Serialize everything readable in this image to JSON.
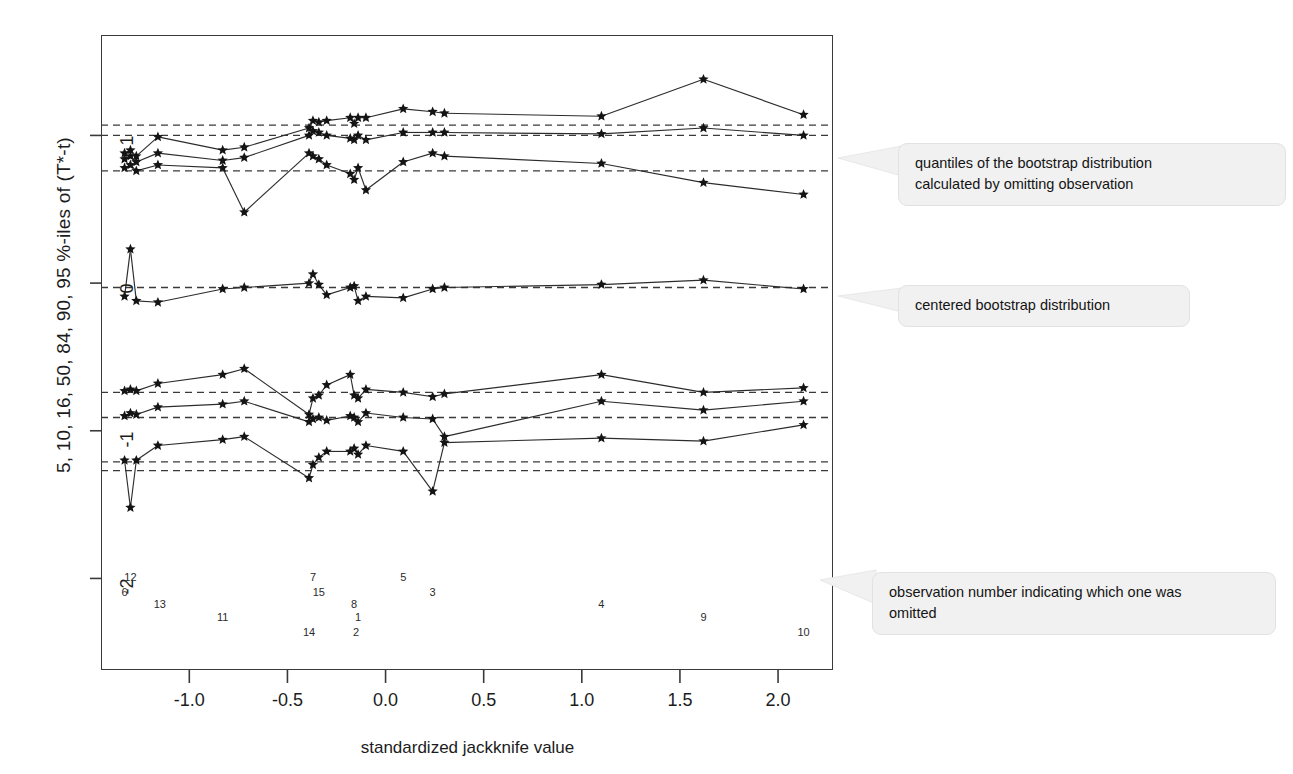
{
  "figure": {
    "ylabel": "5, 10, 16, 50, 84, 90, 95 %-iles of (T*-t)",
    "xlabel": "standardized jackknife value"
  },
  "annotations": [
    {
      "id": "quantiles-note",
      "line1": "quantiles of the bootstrap  distribution",
      "line2": "calculated by omitting observation"
    },
    {
      "id": "centered-note",
      "line1": "centered bootstrap distribution",
      "line2": ""
    },
    {
      "id": "obsnum-note",
      "line1": "observation number indicating which one was",
      "line2": "omitted"
    }
  ],
  "chart_data": {
    "type": "scatter",
    "title": "",
    "xlabel": "standardized jackknife value",
    "ylabel": "5, 10, 16, 50, 84, 90, 95 %-iles of (T*-t)",
    "xlim": [
      -1.45,
      2.28
    ],
    "ylim": [
      -2.62,
      1.68
    ],
    "xticks": [
      -1.0,
      -0.5,
      0.0,
      0.5,
      1.0,
      1.5,
      2.0
    ],
    "xticklabels": [
      "-1.0",
      "-0.5",
      "0.0",
      "0.5",
      "1.0",
      "1.5",
      "2.0"
    ],
    "yticks": [
      1,
      0,
      -1,
      -2
    ],
    "yticklabels": [
      "1",
      "0",
      "-1",
      "-2"
    ],
    "grid": false,
    "legend": null,
    "marker": "asterisk",
    "quantile_levels": [
      5,
      10,
      16,
      50,
      84,
      90,
      95
    ],
    "reference_lines": {
      "description": "horizontal dashed lines = overall bootstrap quantiles",
      "values": [
        1.07,
        1.0,
        0.76,
        -0.03,
        -0.74,
        -0.91,
        -1.21,
        -1.27
      ]
    },
    "observation_labels": [
      {
        "label": "12",
        "x": -1.3,
        "y": -2.0
      },
      {
        "label": "6",
        "x": -1.33,
        "y": -2.1
      },
      {
        "label": "13",
        "x": -1.15,
        "y": -2.18
      },
      {
        "label": "11",
        "x": -0.83,
        "y": -2.27
      },
      {
        "label": "7",
        "x": -0.37,
        "y": -2.0
      },
      {
        "label": "15",
        "x": -0.34,
        "y": -2.1
      },
      {
        "label": "14",
        "x": -0.39,
        "y": -2.37
      },
      {
        "label": "8",
        "x": -0.16,
        "y": -2.18
      },
      {
        "label": "1",
        "x": -0.14,
        "y": -2.27
      },
      {
        "label": "2",
        "x": -0.15,
        "y": -2.37
      },
      {
        "label": "5",
        "x": 0.09,
        "y": -2.0
      },
      {
        "label": "3",
        "x": 0.24,
        "y": -2.1
      },
      {
        "label": "4",
        "x": 1.1,
        "y": -2.18
      },
      {
        "label": "9",
        "x": 1.62,
        "y": -2.27
      },
      {
        "label": "10",
        "x": 2.13,
        "y": -2.37
      }
    ],
    "series": [
      {
        "name": "95%-ile",
        "level": 95,
        "x": [
          -1.33,
          -1.3,
          -1.27,
          -1.16,
          -0.83,
          -0.72,
          -0.39,
          -0.37,
          -0.34,
          -0.3,
          -0.18,
          -0.16,
          -0.14,
          -0.1,
          0.09,
          0.24,
          0.3,
          1.1,
          1.62,
          2.13
        ],
        "y": [
          0.88,
          0.9,
          0.86,
          0.99,
          0.9,
          0.92,
          1.05,
          1.1,
          1.09,
          1.1,
          1.12,
          1.08,
          1.12,
          1.12,
          1.18,
          1.16,
          1.15,
          1.13,
          1.38,
          1.14
        ]
      },
      {
        "name": "90%-ile",
        "level": 90,
        "x": [
          -1.33,
          -1.3,
          -1.27,
          -1.16,
          -0.83,
          -0.72,
          -0.39,
          -0.37,
          -0.34,
          -0.3,
          -0.18,
          -0.16,
          -0.14,
          -0.1,
          0.09,
          0.24,
          0.3,
          1.1,
          1.62,
          2.13
        ],
        "y": [
          0.84,
          0.86,
          0.82,
          0.88,
          0.83,
          0.85,
          1.0,
          1.03,
          1.02,
          1.0,
          0.98,
          0.97,
          1.0,
          0.97,
          1.02,
          1.02,
          1.02,
          1.01,
          1.05,
          1.0
        ]
      },
      {
        "name": "84%-ile",
        "level": 84,
        "x": [
          -1.33,
          -1.3,
          -1.27,
          -1.16,
          -0.83,
          -0.72,
          -0.39,
          -0.37,
          -0.34,
          -0.3,
          -0.18,
          -0.16,
          -0.14,
          -0.1,
          0.09,
          0.24,
          0.3,
          1.1,
          1.62,
          2.13
        ],
        "y": [
          0.78,
          0.8,
          0.76,
          0.8,
          0.78,
          0.48,
          0.88,
          0.86,
          0.84,
          0.8,
          0.74,
          0.7,
          0.78,
          0.63,
          0.82,
          0.88,
          0.86,
          0.81,
          0.68,
          0.6
        ]
      },
      {
        "name": "50%-ile (median)",
        "level": 50,
        "x": [
          -1.33,
          -1.3,
          -1.27,
          -1.16,
          -0.83,
          -0.72,
          -0.39,
          -0.37,
          -0.34,
          -0.3,
          -0.18,
          -0.16,
          -0.14,
          -0.1,
          0.09,
          0.24,
          0.3,
          1.1,
          1.62,
          2.13
        ],
        "y": [
          -0.09,
          0.23,
          -0.12,
          -0.13,
          -0.04,
          -0.03,
          0.0,
          0.06,
          -0.01,
          -0.08,
          -0.03,
          -0.02,
          -0.12,
          -0.09,
          -0.1,
          -0.04,
          -0.03,
          -0.01,
          0.02,
          -0.04
        ]
      },
      {
        "name": "16%-ile",
        "level": 16,
        "x": [
          -1.33,
          -1.3,
          -1.27,
          -1.16,
          -0.83,
          -0.72,
          -0.39,
          -0.37,
          -0.34,
          -0.3,
          -0.18,
          -0.16,
          -0.14,
          -0.1,
          0.09,
          0.24,
          0.3,
          1.1,
          1.62,
          2.13
        ],
        "y": [
          -0.73,
          -0.72,
          -0.73,
          -0.68,
          -0.62,
          -0.58,
          -0.89,
          -0.78,
          -0.76,
          -0.69,
          -0.62,
          -0.76,
          -0.78,
          -0.72,
          -0.74,
          -0.77,
          -0.75,
          -0.62,
          -0.74,
          -0.71
        ]
      },
      {
        "name": "10%-ile",
        "level": 10,
        "x": [
          -1.33,
          -1.3,
          -1.27,
          -1.16,
          -0.83,
          -0.72,
          -0.39,
          -0.37,
          -0.34,
          -0.3,
          -0.18,
          -0.16,
          -0.14,
          -0.1,
          0.09,
          0.24,
          0.3,
          1.1,
          1.62,
          2.13
        ],
        "y": [
          -0.9,
          -0.88,
          -0.89,
          -0.84,
          -0.82,
          -0.8,
          -0.94,
          -0.92,
          -0.91,
          -0.93,
          -0.9,
          -0.91,
          -0.94,
          -0.88,
          -0.91,
          -0.92,
          -1.04,
          -0.8,
          -0.86,
          -0.8
        ]
      },
      {
        "name": "5%-ile",
        "level": 5,
        "x": [
          -1.33,
          -1.3,
          -1.27,
          -1.16,
          -0.83,
          -0.72,
          -0.39,
          -0.37,
          -0.34,
          -0.3,
          -0.18,
          -0.16,
          -0.14,
          -0.1,
          0.09,
          0.24,
          0.3,
          1.1,
          1.62,
          2.13
        ],
        "y": [
          -1.2,
          -1.52,
          -1.2,
          -1.1,
          -1.06,
          -1.04,
          -1.32,
          -1.23,
          -1.18,
          -1.14,
          -1.14,
          -1.12,
          -1.16,
          -1.1,
          -1.14,
          -1.41,
          -1.08,
          -1.05,
          -1.07,
          -0.96
        ]
      }
    ]
  }
}
